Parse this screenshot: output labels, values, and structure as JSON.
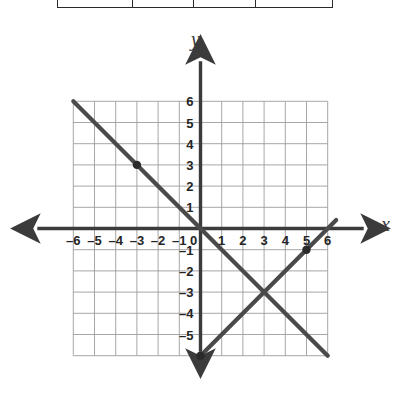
{
  "figure": {
    "type": "coordinate-plane",
    "axis_labels": {
      "x": "x",
      "y": "y"
    },
    "grid": {
      "visible": true,
      "color": "#9a9a9a",
      "x_range": [
        -6,
        6
      ],
      "y_range": [
        -6,
        6
      ]
    },
    "colors": {
      "grid": "#9d9d9d",
      "axis": "#3b3b3b",
      "line": "#4a4a4a",
      "point": "#2a2a2a",
      "table_border": "#2b2b2b"
    }
  },
  "table_fragment": {
    "visible": true,
    "columns": [
      "",
      "",
      "",
      ""
    ]
  },
  "chart_data": {
    "type": "line",
    "title": "",
    "xlabel": "x",
    "ylabel": "y",
    "xlim": [
      -6,
      6
    ],
    "ylim": [
      -6,
      6
    ],
    "grid": true,
    "legend": "none",
    "x_ticks": [
      -6,
      -5,
      -4,
      -3,
      -2,
      -1,
      0,
      1,
      2,
      3,
      4,
      5,
      6
    ],
    "x_tick_labels": [
      "-6",
      "-5",
      "-4",
      "-3",
      "-2",
      "-1",
      "0",
      "1",
      "2",
      "3",
      "4",
      "5",
      "6"
    ],
    "y_ticks": [
      6,
      5,
      4,
      3,
      2,
      1,
      0,
      -1,
      -2,
      -3,
      -4,
      -5
    ],
    "y_tick_labels": [
      "6",
      "5",
      "4",
      "3",
      "2",
      "1",
      "0",
      "-1",
      "-2",
      "-3",
      "-4",
      "-5"
    ],
    "series": [
      {
        "name": "line-1",
        "equation": "y = -x",
        "slope": -1,
        "intercept": 0,
        "x": [
          -6,
          6
        ],
        "y": [
          6,
          -6
        ],
        "marked_points": [
          [
            -3,
            3
          ]
        ]
      },
      {
        "name": "line-2",
        "equation": "y = x - 6",
        "slope": 1,
        "intercept": -6,
        "x": [
          0,
          6.4
        ],
        "y": [
          -6,
          0.4
        ],
        "marked_points": [
          [
            0,
            -6
          ],
          [
            5,
            -1
          ]
        ]
      }
    ],
    "intersection": [
      3,
      -3
    ],
    "annotations": []
  }
}
